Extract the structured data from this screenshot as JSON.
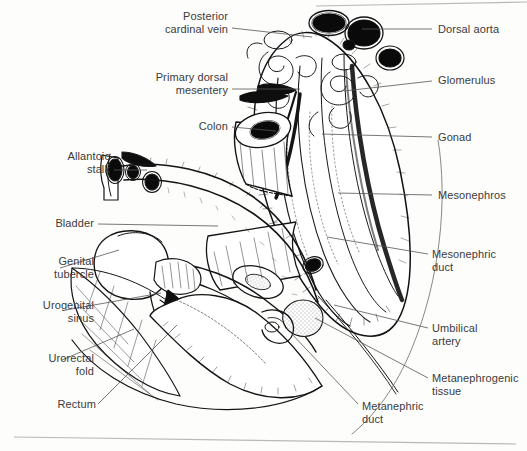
{
  "figure": {
    "style": "pen-and-ink line drawing, scanned textbook plate",
    "background_color": "#fdfdfc",
    "ink_color": "#1a1a1a",
    "label_text_color": "#3b3b3b",
    "leader_line_color": "#555555",
    "scan_rule_color": "#b9b9b9"
  },
  "labels": [
    {
      "id": "posterior-cardinal-vein",
      "text": "Posterior\ncardinal vein",
      "align": "right",
      "x": 118,
      "y": 10,
      "width": 110,
      "leader": {
        "x1": 232,
        "y1": 28,
        "x2": 312,
        "y2": 37
      }
    },
    {
      "id": "primary-dorsal-mesentery",
      "text": "Primary dorsal\nmesentery",
      "align": "right",
      "x": 110,
      "y": 71,
      "width": 118,
      "leader": {
        "x1": 232,
        "y1": 89,
        "x2": 300,
        "y2": 89
      }
    },
    {
      "id": "colon",
      "text": "Colon",
      "align": "right",
      "x": 150,
      "y": 120,
      "width": 78,
      "leader": {
        "x1": 232,
        "y1": 127,
        "x2": 276,
        "y2": 131
      }
    },
    {
      "id": "allantoic-stalk",
      "text": "Allantoic\nstalk",
      "align": "right",
      "x": 30,
      "y": 150,
      "width": 80,
      "leader": {
        "x1": 114,
        "y1": 170,
        "x2": 147,
        "y2": 170
      }
    },
    {
      "id": "bladder",
      "text": "Bladder",
      "align": "right",
      "x": 14,
      "y": 217,
      "width": 80,
      "leader": {
        "x1": 98,
        "y1": 224,
        "x2": 218,
        "y2": 226
      }
    },
    {
      "id": "genital-tubercle",
      "text": "Genital\ntubercle",
      "align": "right",
      "x": 8,
      "y": 255,
      "width": 86,
      "leader": {
        "x1": 60,
        "y1": 268,
        "x2": 119,
        "y2": 250
      }
    },
    {
      "id": "urogenital-sinus",
      "text": "Urogenital\nsinus",
      "align": "right",
      "x": 2,
      "y": 299,
      "width": 92,
      "leader": {
        "x1": 66,
        "y1": 310,
        "x2": 161,
        "y2": 293
      }
    },
    {
      "id": "urorectal-fold",
      "text": "Urorectal\nfold",
      "align": "right",
      "x": 6,
      "y": 352,
      "width": 88,
      "leader": {
        "x1": 62,
        "y1": 360,
        "x2": 134,
        "y2": 329
      }
    },
    {
      "id": "rectum",
      "text": "Rectum",
      "align": "right",
      "x": 24,
      "y": 398,
      "width": 72,
      "leader": {
        "x1": 98,
        "y1": 404,
        "x2": 177,
        "y2": 325
      }
    },
    {
      "id": "dorsal-aorta",
      "text": "Dorsal aorta",
      "align": "left",
      "x": 438,
      "y": 23,
      "width": 86,
      "leader": {
        "x1": 362,
        "y1": 29,
        "x2": 432,
        "y2": 29
      }
    },
    {
      "id": "glomerulus",
      "text": "Glomerulus",
      "align": "left",
      "x": 438,
      "y": 74,
      "width": 86,
      "leader": {
        "x1": 344,
        "y1": 91,
        "x2": 432,
        "y2": 81
      }
    },
    {
      "id": "gonad",
      "text": "Gonad",
      "align": "left",
      "x": 438,
      "y": 131,
      "width": 80,
      "leader": {
        "x1": 322,
        "y1": 134,
        "x2": 432,
        "y2": 137
      }
    },
    {
      "id": "mesonephros",
      "text": "Mesonephros",
      "align": "left",
      "x": 438,
      "y": 189,
      "width": 88,
      "leader": {
        "x1": 338,
        "y1": 193,
        "x2": 432,
        "y2": 195
      }
    },
    {
      "id": "mesonephric-duct",
      "text": "Mesonephric\nduct",
      "align": "left",
      "x": 432,
      "y": 248,
      "width": 92,
      "leader": {
        "x1": 327,
        "y1": 237,
        "x2": 428,
        "y2": 254
      }
    },
    {
      "id": "umbilical-artery",
      "text": "Umbilical\nartery",
      "align": "left",
      "x": 432,
      "y": 322,
      "width": 88,
      "leader": {
        "x1": 334,
        "y1": 305,
        "x2": 428,
        "y2": 328
      }
    },
    {
      "id": "metanephrogenic-tissue",
      "text": "Metanephrogenic\ntissue",
      "align": "left",
      "x": 432,
      "y": 372,
      "width": 96,
      "leader": {
        "x1": 315,
        "y1": 318,
        "x2": 428,
        "y2": 378
      }
    },
    {
      "id": "metanephric-duct",
      "text": "Metanephric\nduct",
      "align": "left",
      "x": 362,
      "y": 400,
      "width": 92,
      "leader": {
        "x1": 290,
        "y1": 332,
        "x2": 358,
        "y2": 404
      }
    }
  ],
  "scan_rules": [
    {
      "id": "top-rule",
      "x1": 316,
      "y1": 6,
      "x2": 527,
      "y2": 2
    },
    {
      "id": "bottom-rule",
      "x1": 14,
      "y1": 437,
      "x2": 516,
      "y2": 444
    }
  ]
}
